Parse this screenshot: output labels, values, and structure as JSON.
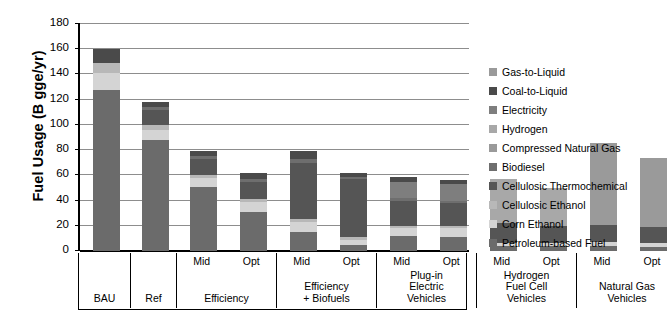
{
  "chart_data": {
    "type": "bar",
    "subtype": "stacked-bar",
    "title": "",
    "xlabel": "",
    "ylabel": "Fuel Usage (B gge/yr)",
    "ylim": [
      0,
      180
    ],
    "yticks": [
      0,
      20,
      40,
      60,
      80,
      100,
      120,
      140,
      160,
      180
    ],
    "grid": true,
    "legend_position": "right",
    "legend": [
      {
        "name": "Gas-to-Liquid",
        "color": "#9a9a9a"
      },
      {
        "name": "Coal-to-Liquid",
        "color": "#4a4a4a"
      },
      {
        "name": "Electricity",
        "color": "#7e7e7e"
      },
      {
        "name": "Hydrogen",
        "color": "#a8a8a8"
      },
      {
        "name": "Compressed Natural Gas",
        "color": "#9a9a9a"
      },
      {
        "name": "Biodiesel",
        "color": "#6e6e6e"
      },
      {
        "name": "Cellulosic Thermochemical",
        "color": "#555555"
      },
      {
        "name": "Cellulosic Ethanol",
        "color": "#b8b8b8"
      },
      {
        "name": "Corn Ethanol",
        "color": "#d4d4d4"
      },
      {
        "name": "Petroleum-based Fuel",
        "color": "#6b6b6b"
      }
    ],
    "groups": [
      {
        "label": "BAU",
        "scenarios": []
      },
      {
        "label": "Ref",
        "scenarios": []
      },
      {
        "label": "Efficiency",
        "scenarios": [
          "Mid",
          "Opt"
        ]
      },
      {
        "label": "Efficiency\n+ Biofuels",
        "scenarios": [
          "Mid",
          "Opt"
        ]
      },
      {
        "label": "Plug-in\nElectric\nVehicles",
        "scenarios": [
          "Mid",
          "Opt"
        ]
      },
      {
        "label": "Hydrogen\nFuel Cell\nVehicles",
        "scenarios": [
          "Mid",
          "Opt"
        ]
      },
      {
        "label": "Natural Gas\nVehicles",
        "scenarios": [
          "Mid",
          "Opt"
        ]
      }
    ],
    "series_order": [
      "Petroleum-based Fuel",
      "Corn Ethanol",
      "Cellulosic Ethanol",
      "Cellulosic Thermochemical",
      "Biodiesel",
      "Compressed Natural Gas",
      "Hydrogen",
      "Electricity",
      "Coal-to-Liquid",
      "Gas-to-Liquid"
    ],
    "bars": [
      {
        "group": "BAU",
        "scenario": "",
        "total": 160,
        "segments": [
          {
            "name": "Petroleum-based Fuel",
            "value": 128
          },
          {
            "name": "Corn Ethanol",
            "value": 13
          },
          {
            "name": "Cellulosic Ethanol",
            "value": 8
          },
          {
            "name": "Coal-to-Liquid",
            "value": 11
          }
        ]
      },
      {
        "group": "Ref",
        "scenario": "",
        "total": 118,
        "segments": [
          {
            "name": "Petroleum-based Fuel",
            "value": 88
          },
          {
            "name": "Corn Ethanol",
            "value": 8
          },
          {
            "name": "Cellulosic Ethanol",
            "value": 4
          },
          {
            "name": "Cellulosic Thermochemical",
            "value": 12
          },
          {
            "name": "Biodiesel",
            "value": 2
          },
          {
            "name": "Coal-to-Liquid",
            "value": 4
          }
        ]
      },
      {
        "group": "Efficiency",
        "scenario": "Mid",
        "total": 79,
        "segments": [
          {
            "name": "Petroleum-based Fuel",
            "value": 51
          },
          {
            "name": "Corn Ethanol",
            "value": 7
          },
          {
            "name": "Cellulosic Ethanol",
            "value": 2
          },
          {
            "name": "Cellulosic Thermochemical",
            "value": 13
          },
          {
            "name": "Biodiesel",
            "value": 2
          },
          {
            "name": "Coal-to-Liquid",
            "value": 4
          }
        ]
      },
      {
        "group": "Efficiency",
        "scenario": "Opt",
        "total": 62,
        "segments": [
          {
            "name": "Petroleum-based Fuel",
            "value": 31
          },
          {
            "name": "Corn Ethanol",
            "value": 8
          },
          {
            "name": "Cellulosic Ethanol",
            "value": 2
          },
          {
            "name": "Cellulosic Thermochemical",
            "value": 14
          },
          {
            "name": "Biodiesel",
            "value": 2
          },
          {
            "name": "Coal-to-Liquid",
            "value": 5
          }
        ]
      },
      {
        "group": "Efficiency + Biofuels",
        "scenario": "Mid",
        "total": 79,
        "segments": [
          {
            "name": "Petroleum-based Fuel",
            "value": 15
          },
          {
            "name": "Corn Ethanol",
            "value": 8
          },
          {
            "name": "Cellulosic Ethanol",
            "value": 2
          },
          {
            "name": "Cellulosic Thermochemical",
            "value": 45
          },
          {
            "name": "Biodiesel",
            "value": 3
          },
          {
            "name": "Coal-to-Liquid",
            "value": 6
          }
        ]
      },
      {
        "group": "Efficiency + Biofuels",
        "scenario": "Opt",
        "total": 62,
        "segments": [
          {
            "name": "Petroleum-based Fuel",
            "value": 5
          },
          {
            "name": "Corn Ethanol",
            "value": 4
          },
          {
            "name": "Cellulosic Ethanol",
            "value": 2
          },
          {
            "name": "Cellulosic Thermochemical",
            "value": 46
          },
          {
            "name": "Biodiesel",
            "value": 2
          },
          {
            "name": "Coal-to-Liquid",
            "value": 3
          }
        ]
      },
      {
        "group": "Plug-in Electric Vehicles",
        "scenario": "Mid",
        "total": 59,
        "segments": [
          {
            "name": "Petroleum-based Fuel",
            "value": 12
          },
          {
            "name": "Corn Ethanol",
            "value": 6
          },
          {
            "name": "Cellulosic Ethanol",
            "value": 2
          },
          {
            "name": "Cellulosic Thermochemical",
            "value": 20
          },
          {
            "name": "Biodiesel",
            "value": 2
          },
          {
            "name": "Electricity",
            "value": 13
          },
          {
            "name": "Coal-to-Liquid",
            "value": 4
          }
        ]
      },
      {
        "group": "Plug-in Electric Vehicles",
        "scenario": "Opt",
        "total": 56,
        "segments": [
          {
            "name": "Petroleum-based Fuel",
            "value": 11
          },
          {
            "name": "Corn Ethanol",
            "value": 7
          },
          {
            "name": "Cellulosic Ethanol",
            "value": 2
          },
          {
            "name": "Cellulosic Thermochemical",
            "value": 18
          },
          {
            "name": "Biodiesel",
            "value": 2
          },
          {
            "name": "Electricity",
            "value": 13
          },
          {
            "name": "Coal-to-Liquid",
            "value": 3
          }
        ]
      },
      {
        "group": "Hydrogen Fuel Cell Vehicles",
        "scenario": "Mid",
        "total": 57,
        "segments": [
          {
            "name": "Petroleum-based Fuel",
            "value": 4
          },
          {
            "name": "Corn Ethanol",
            "value": 2
          },
          {
            "name": "Cellulosic Thermochemical",
            "value": 16
          },
          {
            "name": "Hydrogen",
            "value": 35
          }
        ]
      },
      {
        "group": "Hydrogen Fuel Cell Vehicles",
        "scenario": "Opt",
        "total": 50,
        "segments": [
          {
            "name": "Petroleum-based Fuel",
            "value": 4
          },
          {
            "name": "Corn Ethanol",
            "value": 2
          },
          {
            "name": "Cellulosic Thermochemical",
            "value": 14
          },
          {
            "name": "Hydrogen",
            "value": 30
          }
        ]
      },
      {
        "group": "Natural Gas Vehicles",
        "scenario": "Mid",
        "total": 86,
        "segments": [
          {
            "name": "Petroleum-based Fuel",
            "value": 4
          },
          {
            "name": "Corn Ethanol",
            "value": 3
          },
          {
            "name": "Cellulosic Thermochemical",
            "value": 14
          },
          {
            "name": "Compressed Natural Gas",
            "value": 65
          }
        ]
      },
      {
        "group": "Natural Gas Vehicles",
        "scenario": "Opt",
        "total": 74,
        "segments": [
          {
            "name": "Petroleum-based Fuel",
            "value": 3
          },
          {
            "name": "Corn Ethanol",
            "value": 3
          },
          {
            "name": "Cellulosic Thermochemical",
            "value": 13
          },
          {
            "name": "Compressed Natural Gas",
            "value": 55
          }
        ]
      }
    ]
  },
  "layout": {
    "group_cell_widths": [
      52,
      46,
      100,
      100,
      100,
      100,
      100
    ],
    "bar_width": 27
  }
}
